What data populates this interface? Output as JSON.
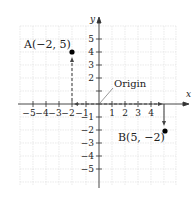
{
  "diagram": {
    "type": "coordinate-plane",
    "x_axis_label": "x",
    "y_axis_label": "y",
    "x_ticks": [
      "−5",
      "−4",
      "−3",
      "−2",
      "−1",
      "1",
      "2",
      "3",
      "4"
    ],
    "y_ticks_pos": [
      "5",
      "4",
      "3",
      "2",
      "1"
    ],
    "y_ticks_neg": [
      "−1",
      "−2",
      "−3",
      "−4",
      "−5"
    ],
    "origin_label": "Origin",
    "points": [
      {
        "name": "A",
        "label": "A(−2, 5)",
        "color": "#000000"
      },
      {
        "name": "B",
        "label": "B(5, −2)",
        "color": "#000000"
      }
    ],
    "colors": {
      "grid": "#d8d8d8",
      "axis": "#333333",
      "path": "#444444"
    }
  }
}
